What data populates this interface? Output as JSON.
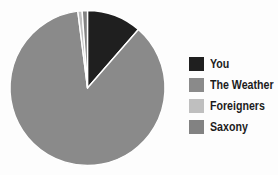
{
  "chart_data": {
    "type": "pie",
    "title": "",
    "categories": [
      "You",
      "The Weather",
      "Foreigners",
      "Saxony"
    ],
    "values": [
      11.4,
      86.6,
      0.9,
      1.1
    ],
    "colors": [
      "#1f1f1f",
      "#8a8a8a",
      "#bfbfbf",
      "#828282"
    ],
    "legend_position": "right",
    "start_angle_deg": 0,
    "direction": "clockwise",
    "slice_border_color": "#ffffff",
    "background_color": "#fdfdfd",
    "center": [
      87.5,
      88
    ],
    "radius": 77.5
  }
}
